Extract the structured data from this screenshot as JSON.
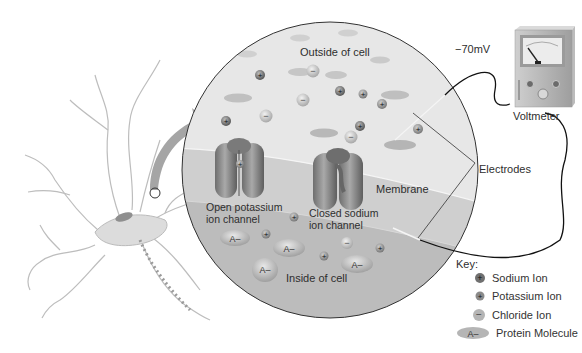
{
  "diagram": {
    "type": "neuron resting membrane potential illustration",
    "labels": {
      "outside": "Outside of cell",
      "inside": "Inside of cell",
      "membrane": "Membrane",
      "open_channel_line1": "Open potassium",
      "open_channel_line2": "ion channel",
      "closed_channel_line1": "Closed sodium",
      "closed_channel_line2": "ion channel",
      "voltage": "−70mV",
      "voltmeter": "Voltmeter",
      "electrodes": "Electrodes",
      "protein_symbol": "A–"
    },
    "key": {
      "title": "Key:",
      "items": [
        {
          "icon": "sodium-ion-icon",
          "symbol": "+",
          "label": "Sodium Ion"
        },
        {
          "icon": "potassium-ion-icon",
          "symbol": "+",
          "label": "Potassium Ion"
        },
        {
          "icon": "chloride-ion-icon",
          "symbol": "−",
          "label": "Chloride Ion"
        },
        {
          "icon": "protein-molecule-icon",
          "symbol": "A–",
          "label": "Protein Molecule"
        }
      ]
    },
    "colors": {
      "outside_fill": "#e6e6e6",
      "membrane_fill": "#cfcfcf",
      "inside_fill": "#bdbdbd",
      "channel": "#8a8a8a",
      "line": "#222222"
    }
  }
}
